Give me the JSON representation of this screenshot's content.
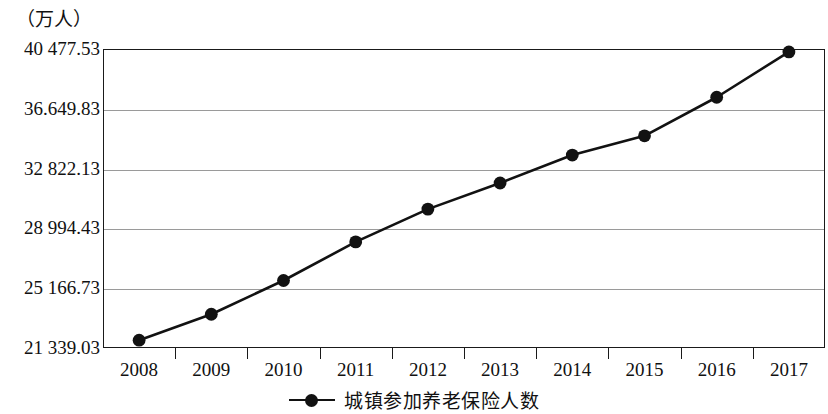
{
  "chart_data": {
    "type": "line",
    "title": "",
    "subtitle": "",
    "xlabel": "",
    "ylabel": "（万人）",
    "y_unit_caption": "（万人）",
    "categories": [
      "2008",
      "2009",
      "2010",
      "2011",
      "2012",
      "2013",
      "2014",
      "2015",
      "2016",
      "2017"
    ],
    "series": [
      {
        "name": "城镇参加养老保险人数",
        "values": [
          21840,
          23500,
          25660,
          28130,
          30230,
          31900,
          33690,
          34920,
          37390,
          40290
        ]
      }
    ],
    "y_tick_labels": [
      "40 477.53",
      "36.649.83",
      "32 822.13",
      "28 994.43",
      "25 166.73",
      "21 339.03"
    ],
    "y_tick_values": [
      40477.53,
      36649.83,
      32822.13,
      28994.43,
      25166.73,
      21339.03
    ],
    "ylim": [
      21339.03,
      40477.53
    ],
    "grid": true,
    "grid_axis": "y",
    "legend": [
      {
        "label": "城镇参加养老保险人数",
        "marker": "line-with-circle",
        "color": "#121212"
      }
    ],
    "legend_position": "bottom-center",
    "marker_style": "filled-circle",
    "line_color": "#121212",
    "marker_color": "#121212",
    "plot_background": "#ffffff",
    "frame_color": "#1a1a1a",
    "gridline_color": "#9a9a9a"
  },
  "legend": {
    "label": "城镇参加养老保险人数"
  },
  "axes": {
    "y_caption": "（万人）",
    "y_ticks": [
      {
        "label": "40 477.53",
        "value": 40477.53
      },
      {
        "label": "36.649.83",
        "value": 36649.83
      },
      {
        "label": "32 822.13",
        "value": 32822.13
      },
      {
        "label": "28 994.43",
        "value": 28994.43
      },
      {
        "label": "25 166.73",
        "value": 25166.73
      },
      {
        "label": "21 339.03",
        "value": 21339.03
      }
    ],
    "x_ticks": [
      "2008",
      "2009",
      "2010",
      "2011",
      "2012",
      "2013",
      "2014",
      "2015",
      "2016",
      "2017"
    ]
  }
}
